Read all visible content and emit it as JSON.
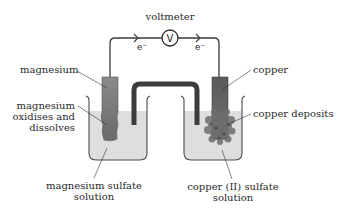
{
  "diagram": {
    "type": "galvanic cell (magnesium–copper)",
    "colors": {
      "wire": "#3a3a3a",
      "beaker_outline": "#4a4a4a",
      "solution": "#dcdcdc",
      "salt_bridge": "#3c3c3c",
      "magnesium": "#7a7a7a",
      "copper": "#5a5a5a",
      "copper_deposit": "#6b6b6b"
    },
    "voltmeter": {
      "label": "voltmeter",
      "symbol": "V"
    },
    "electron_flow": {
      "left": "e⁻",
      "right": "e⁻"
    },
    "labels": {
      "magnesium": "magnesium",
      "mg_oxidises_1": "magnesium",
      "mg_oxidises_2": "oxidises and",
      "mg_oxidises_3": "dissolves",
      "mg_solution_1": "magnesium sulfate",
      "mg_solution_2": "solution",
      "copper": "copper",
      "copper_deposits": "copper deposits",
      "cu_solution_1": "copper (II) sulfate",
      "cu_solution_2": "solution"
    }
  }
}
